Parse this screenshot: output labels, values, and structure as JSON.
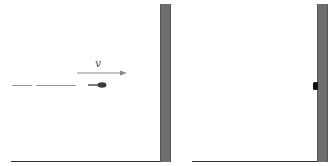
{
  "diagram": {
    "left_panel": {
      "velocity_label": "v",
      "elements": [
        "bullet",
        "motion-trail",
        "velocity-arrow",
        "wall",
        "ground"
      ]
    },
    "right_panel": {
      "elements": [
        "bullet-embedded-in-wall",
        "wall",
        "ground"
      ]
    },
    "colors": {
      "wall": "#6e6e6e",
      "ground": "#333333",
      "bullet": "#3a3a3a",
      "arrow": "#888888",
      "trail": "#999999"
    }
  }
}
